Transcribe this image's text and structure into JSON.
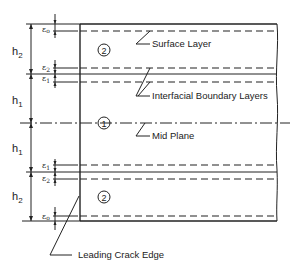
{
  "diagram": {
    "labels": {
      "surface_layer": "Surface Layer",
      "interfacial_layers": "Interfacial Boundary Layers",
      "mid_plane": "Mid Plane",
      "leading_crack_edge": "Leading Crack Edge"
    },
    "regions": {
      "outer": "2",
      "inner": "1"
    },
    "dimensions": {
      "h2_top": "h",
      "h2_top_sub": "2",
      "h1_top": "h",
      "h1_top_sub": "1",
      "h1_bottom": "h",
      "h1_bottom_sub": "1",
      "h2_bottom": "h",
      "h2_bottom_sub": "2"
    },
    "epsilons": {
      "eps0_top": "ε",
      "eps0_top_sub": "o",
      "eps2_top": "ε",
      "eps2_top_sub": "2",
      "eps1_top": "ε",
      "eps1_top_sub": "1",
      "eps1_bottom": "ε",
      "eps1_bottom_sub": "1",
      "eps2_bottom": "ε",
      "eps2_bottom_sub": "2",
      "eps0_bottom": "ε",
      "eps0_bottom_sub": "o"
    }
  }
}
